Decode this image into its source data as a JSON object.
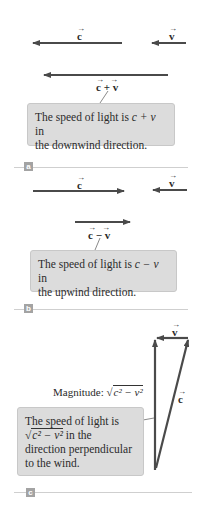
{
  "colors": {
    "arrow": "#4a4a4a",
    "box_fill": "#dcdcdc",
    "tag_fill": "#a3a3a3",
    "rule": "#cfcfcf"
  },
  "panels": [
    {
      "tag": "a",
      "vectors": {
        "c": "c",
        "v": "v",
        "result": "c + v"
      },
      "callout": {
        "line1_pre": "The speed of light is ",
        "expr": "c + v",
        "line1_post": " in",
        "line2": "the downwind direction."
      }
    },
    {
      "tag": "b",
      "vectors": {
        "c": "c",
        "v": "v",
        "result": "c − v"
      },
      "callout": {
        "line1_pre": "The speed of light is ",
        "expr": "c − v",
        "line1_post": " in",
        "line2": "the upwind direction."
      }
    },
    {
      "tag": "c",
      "vectors": {
        "c": "c",
        "v": "v"
      },
      "magnitude_label": "Magnitude: ",
      "magnitude_expr": "c² − v²",
      "callout": {
        "line1": "The speed of light is",
        "expr": "c² − v²",
        "line2_post": " in the",
        "line3": "direction perpendicular",
        "line4": "to the wind."
      }
    }
  ]
}
